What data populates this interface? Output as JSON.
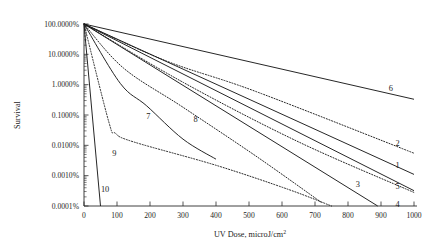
{
  "chart_data": {
    "type": "line",
    "title": "",
    "xlabel": "UV Dose, microJ/cm2",
    "xlabel_base": "UV Dose, microJ/cm",
    "xlabel_exp": "2",
    "ylabel": "Survival",
    "xlim": [
      0,
      1000
    ],
    "ylim_percent": [
      0.0001,
      100
    ],
    "yscale": "log",
    "grid": false,
    "legend": "inline-end-labels",
    "xticks": [
      0,
      100,
      200,
      300,
      400,
      500,
      600,
      700,
      800,
      900,
      1000
    ],
    "xtick_labels": [
      "0",
      "100",
      "200",
      "300",
      "400",
      "500",
      "600",
      "700",
      "800",
      "900",
      "1000"
    ],
    "yticks": [
      100,
      10,
      1,
      0.1,
      0.01,
      0.001,
      0.0001
    ],
    "ytick_labels": [
      "100.0000%",
      "10.0000%",
      "1.0000%",
      "0.1000%",
      "0.0100%",
      "0.0010%",
      "0.0001%"
    ],
    "series": [
      {
        "name": "1",
        "label": "1",
        "style": "solid",
        "label_x": 950,
        "label_y_percent": 0.0022,
        "points": [
          [
            0,
            100
          ],
          [
            1000,
            0.0011
          ]
        ]
      },
      {
        "name": "2",
        "label": "2",
        "style": "dotted",
        "label_x": 950,
        "label_y_percent": 0.012,
        "points": [
          [
            0,
            100
          ],
          [
            250,
            6
          ],
          [
            520,
            0.6
          ],
          [
            1000,
            0.0055
          ]
        ]
      },
      {
        "name": "3",
        "label": "3",
        "style": "solid",
        "label_x": 830,
        "label_y_percent": 0.00055,
        "points": [
          [
            0,
            100
          ],
          [
            890,
            0.0001
          ]
        ]
      },
      {
        "name": "4",
        "label": "4",
        "style": "dotted",
        "label_x": 950,
        "label_y_percent": 0.000115,
        "points": [
          [
            0,
            100
          ],
          [
            300,
            1.2
          ],
          [
            650,
            0.013
          ],
          [
            1000,
            0.00028
          ]
        ]
      },
      {
        "name": "5",
        "label": "5",
        "style": "solid",
        "label_x": 950,
        "label_y_percent": 0.00046,
        "points": [
          [
            0,
            100
          ],
          [
            1000,
            0.00032
          ]
        ]
      },
      {
        "name": "6",
        "label": "6",
        "style": "solid",
        "label_x": 930,
        "label_y_percent": 0.75,
        "points": [
          [
            0,
            100
          ],
          [
            1000,
            0.33
          ]
        ]
      },
      {
        "name": "7",
        "label": "7",
        "style": "solid",
        "label_x": 195,
        "label_y_percent": 0.095,
        "points": [
          [
            0,
            100
          ],
          [
            110,
            1.1
          ],
          [
            190,
            0.2
          ],
          [
            300,
            0.016
          ],
          [
            400,
            0.0035
          ]
        ]
      },
      {
        "name": "8",
        "label": "8",
        "style": "dotted",
        "label_x": 338,
        "label_y_percent": 0.075,
        "points": [
          [
            0,
            100
          ],
          [
            120,
            3.5
          ],
          [
            300,
            0.18
          ],
          [
            520,
            0.0045
          ],
          [
            720,
            0.00013
          ]
        ]
      },
      {
        "name": "9",
        "label": "9",
        "style": "dotted",
        "label_x": 92,
        "label_y_percent": 0.0058,
        "points": [
          [
            0,
            100
          ],
          [
            75,
            0.06
          ],
          [
            95,
            0.025
          ],
          [
            150,
            0.013
          ],
          [
            400,
            0.0022
          ],
          [
            620,
            0.00035
          ],
          [
            750,
            0.0001
          ]
        ]
      },
      {
        "name": "10",
        "label": "10",
        "style": "solid",
        "label_x": 64,
        "label_y_percent": 0.00035,
        "points": [
          [
            0,
            100
          ],
          [
            50,
            0.0001
          ]
        ]
      }
    ]
  }
}
